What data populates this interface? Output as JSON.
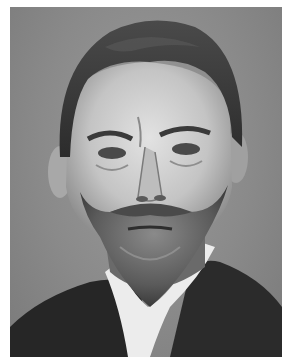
{
  "image": {
    "subject": "black-and-white portrait of a bearded man in a dark suit with white collar",
    "tones": {
      "border": "#ffffff",
      "background": "#8c8c8c",
      "hair": "#3a3a3a",
      "skin": "#cfcfcf",
      "beard": "#5e5e5e",
      "suit": "#2a2a2a",
      "collar": "#ececec"
    }
  }
}
